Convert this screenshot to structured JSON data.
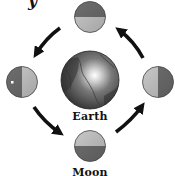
{
  "diagram": {
    "type": "moon-phases-orbit",
    "center_body": {
      "label": "Earth",
      "icon": "earth-globe-icon"
    },
    "orbiting_body_label": "Moon",
    "top_cutoff_glyph": "y",
    "orbit_direction": "counterclockwise",
    "moons": [
      {
        "position": "top",
        "dark_side": "top",
        "lit_side": "bottom"
      },
      {
        "position": "left",
        "dark_side": "left",
        "lit_side": "right",
        "marker": "white-dot"
      },
      {
        "position": "bottom",
        "dark_side": "bottom",
        "lit_side": "top"
      },
      {
        "position": "right",
        "dark_side": "right",
        "lit_side": "left"
      }
    ],
    "arrows": [
      {
        "from": "top",
        "to": "left"
      },
      {
        "from": "left",
        "to": "bottom"
      },
      {
        "from": "bottom",
        "to": "right"
      },
      {
        "from": "right",
        "to": "top"
      }
    ],
    "colors": {
      "dark_half": "#6e6e6e",
      "lit_half": "#c8c8c8",
      "earth_base": "#5a5a5a",
      "arrow": "#111111",
      "background": "#ffffff"
    }
  }
}
